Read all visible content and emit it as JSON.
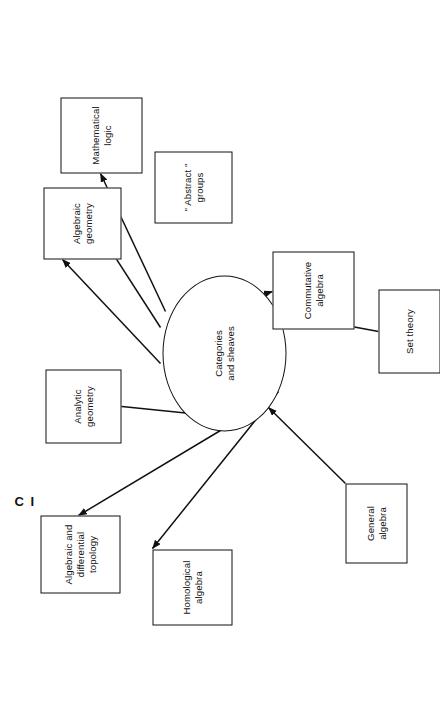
{
  "figure": {
    "caption": "C I",
    "orientation": "rotated-90-ccw",
    "hub": {
      "label": "Categories\nand sheaves"
    },
    "nodes": [
      {
        "id": "mathematical-logic",
        "label": "Mathematical\nlogic"
      },
      {
        "id": "abstract-groups",
        "label": "\" Abstract \"\ngroups"
      },
      {
        "id": "algebraic-geometry",
        "label": "Algebraic\ngeometry"
      },
      {
        "id": "analytic-geometry",
        "label": "Analytic\ngeometry"
      },
      {
        "id": "algebraic-differential-topology",
        "label": "Algebraic and\ndifferential\ntopology"
      },
      {
        "id": "homological-algebra",
        "label": "Homological\nalgebra"
      },
      {
        "id": "commutative-algebra",
        "label": "Commutative\nalgebra"
      },
      {
        "id": "general-algebra",
        "label": "General\nalgebra"
      },
      {
        "id": "set-theory",
        "label": "Set theory"
      }
    ],
    "edges": [
      {
        "from": "hub",
        "to": "mathematical-logic",
        "direction": "out"
      },
      {
        "from": "hub",
        "to": "abstract-groups",
        "direction": "out"
      },
      {
        "from": "hub",
        "to": "algebraic-geometry",
        "direction": "out"
      },
      {
        "from": "hub",
        "to": "analytic-geometry",
        "direction": "out"
      },
      {
        "from": "hub",
        "to": "algebraic-differential-topology",
        "direction": "out"
      },
      {
        "from": "hub",
        "to": "homological-algebra",
        "direction": "out"
      },
      {
        "from": "hub",
        "to": "commutative-algebra",
        "direction": "out"
      },
      {
        "from": "general-algebra",
        "to": "hub",
        "direction": "in"
      },
      {
        "from": "set-theory",
        "to": "hub",
        "direction": "in"
      }
    ],
    "colors": {
      "stroke": "#111111",
      "background": "#ffffff",
      "text": "#111111"
    }
  }
}
